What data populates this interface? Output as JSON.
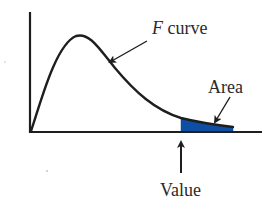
{
  "diagram": {
    "labels": {
      "f_letter": "F",
      "curve_word": " curve",
      "area": "Area",
      "value": "Value"
    },
    "colors": {
      "ink": "#1e1e1e",
      "area_fill": "#0d4fa3",
      "background": "#ffffff"
    },
    "axes": {
      "origin": [
        30,
        132
      ],
      "y_axis_top": 12,
      "x_axis_end": 262
    },
    "curve": {
      "type": "right-skewed density",
      "peak": [
        78,
        36
      ],
      "shaded_region_x": [
        181,
        233
      ]
    }
  }
}
